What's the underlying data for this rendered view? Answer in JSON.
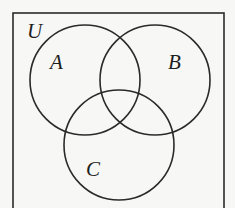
{
  "diagram": {
    "type": "venn",
    "universe": {
      "label": "U",
      "box": {
        "x": 13,
        "y": 13,
        "width": 211,
        "height": 200
      },
      "label_pos": {
        "x": 27,
        "y": 38
      }
    },
    "sets": [
      {
        "id": "A",
        "label": "A",
        "cx": 85,
        "cy": 80,
        "r": 55,
        "label_pos": {
          "x": 50,
          "y": 69
        }
      },
      {
        "id": "B",
        "label": "B",
        "cx": 155,
        "cy": 80,
        "r": 55,
        "label_pos": {
          "x": 168,
          "y": 69
        }
      },
      {
        "id": "C",
        "label": "C",
        "cx": 119,
        "cy": 145,
        "r": 55,
        "label_pos": {
          "x": 86,
          "y": 176
        }
      }
    ],
    "colors": {
      "stroke": "#2a2a2a",
      "text": "#1e1e1e",
      "background": "#f7f7f5"
    }
  }
}
